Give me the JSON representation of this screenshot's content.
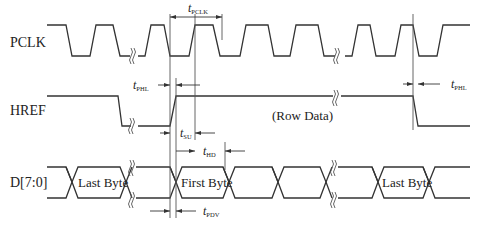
{
  "signals": {
    "pclk": "PCLK",
    "href": "HREF",
    "data": "D[7:0]"
  },
  "bus_labels": {
    "last_byte_1": "Last Byte",
    "first_byte": "First Byte",
    "last_byte_2": "Last Byte",
    "row_data": "(Row Data)"
  },
  "timing": {
    "t_pclk": {
      "main": "t",
      "sub": "PCLK"
    },
    "t_phl_1": {
      "main": "t",
      "sub": "PHL"
    },
    "t_phl_2": {
      "main": "t",
      "sub": "PHL"
    },
    "t_su": {
      "main": "t",
      "sub": "SU"
    },
    "t_hd": {
      "main": "t",
      "sub": "HD"
    },
    "t_pdv": {
      "main": "t",
      "sub": "PDV"
    }
  },
  "colors": {
    "line": "#333333",
    "background": "#ffffff"
  }
}
